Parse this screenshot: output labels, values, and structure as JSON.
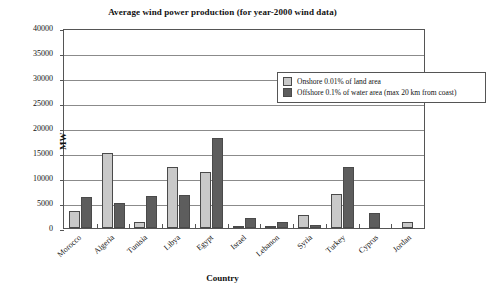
{
  "chart_data": {
    "type": "bar",
    "title": "Average wind power production (for year-2000 wind data)",
    "xlabel": "Country",
    "ylabel": "MW",
    "ylim": [
      0,
      40000
    ],
    "ytick_step": 5000,
    "yticks": [
      "0",
      "5000",
      "10000",
      "15000",
      "20000",
      "25000",
      "30000",
      "35000",
      "40000"
    ],
    "grid": true,
    "legend_position": "top-right-inside",
    "categories": [
      "Morocco",
      "Algeria",
      "Tunisia",
      "Libya",
      "Egypt",
      "Israel",
      "Lebanon",
      "Syria",
      "Turkey",
      "Cyprus",
      "Jordan"
    ],
    "series": [
      {
        "name": "Onshore 0.01% of land area",
        "color": "#c9c9c9",
        "values": [
          3400,
          15000,
          1200,
          12300,
          11200,
          250,
          150,
          2600,
          6800,
          0,
          1300
        ]
      },
      {
        "name": "Offshore 0.1% of water area (max 20 km from coast)",
        "color": "#5d5d5d",
        "values": [
          6300,
          5000,
          6500,
          6600,
          18000,
          2000,
          1200,
          700,
          12200,
          3100,
          0
        ]
      }
    ]
  }
}
